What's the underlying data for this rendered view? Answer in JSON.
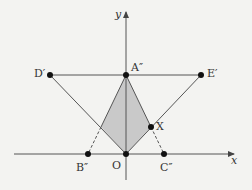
{
  "diagram": {
    "axes": {
      "x_label": "x",
      "y_label": "y"
    },
    "points": {
      "O": "O",
      "A": "A″",
      "B": "B″",
      "C": "C″",
      "D": "D′",
      "E": "E′",
      "X": "X"
    },
    "colors": {
      "line": "#555555",
      "fill": "#c9c9c9",
      "point": "#111111",
      "background": "#f3f3f1"
    }
  }
}
